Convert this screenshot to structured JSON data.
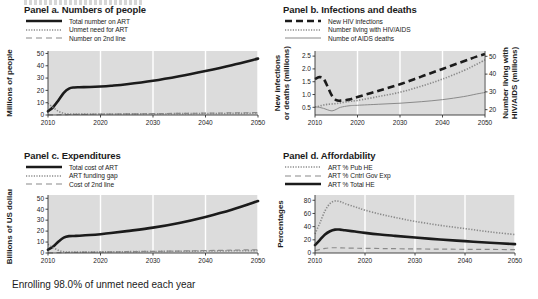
{
  "figure": {
    "caption": "Enrolling 98.0% of unmet need each year",
    "top_partial_text": "",
    "plot_bg": "#dcdcdc",
    "grid_color": "#ffffff",
    "ink": "#1b1b1b"
  },
  "panels": {
    "a": {
      "title": "Panel a. Numbers of people",
      "ylabel": "Millions of people",
      "legend": [
        {
          "label": "Total number on ART",
          "style": "solid-thick",
          "color": "#1a1a1a"
        },
        {
          "label": "Unmet need for ART",
          "style": "dotted",
          "color": "#8a8a8a"
        },
        {
          "label": "Number on 2nd line",
          "style": "dashed",
          "color": "#8a8a8a"
        }
      ]
    },
    "b": {
      "title": "Panel b. Infections and deaths",
      "ylabel_left": "New infections or deaths (millions)",
      "ylabel_right": "Number living with HIV/AIDS (millions)",
      "legend": [
        {
          "label": "New HIV infections",
          "style": "dashed-thick",
          "color": "#1a1a1a"
        },
        {
          "label": "Number living with HIV/AIDS",
          "style": "dotted",
          "color": "#8a8a8a"
        },
        {
          "label": "Numbe of AIDS deaths",
          "style": "solid-thin",
          "color": "#8a8a8a"
        }
      ]
    },
    "c": {
      "title": "Panel c. Expenditures",
      "ylabel": "Billions of  US dollars",
      "legend": [
        {
          "label": "Total cost of ART",
          "style": "solid-thick",
          "color": "#1a1a1a"
        },
        {
          "label": "ART funding gap",
          "style": "dotted",
          "color": "#8a8a8a"
        },
        {
          "label": "Cost of 2nd line",
          "style": "dashed",
          "color": "#8a8a8a"
        }
      ]
    },
    "d": {
      "title": "Panel d. Affordability",
      "ylabel": "Percentages",
      "legend": [
        {
          "label": "ART % Pub HE",
          "style": "dotted",
          "color": "#8a8a8a"
        },
        {
          "label": "ART % Cntrl Gov Exp",
          "style": "dashed",
          "color": "#8a8a8a"
        },
        {
          "label": "ART % Total HE",
          "style": "solid-thick",
          "color": "#1a1a1a"
        }
      ]
    }
  },
  "chart_data": [
    {
      "id": "a",
      "type": "line",
      "title": "Panel a. Numbers of people",
      "xlabel": "",
      "ylabel": "Millions of people",
      "xlim": [
        2010,
        2050
      ],
      "ylim": [
        0,
        52
      ],
      "xticks": [
        2010,
        2020,
        2030,
        2040,
        2050
      ],
      "yticks": [
        0,
        10,
        20,
        30,
        40,
        50
      ],
      "grid": "vertical",
      "legend_position": "above-left",
      "x": [
        2010,
        2011,
        2012,
        2013,
        2014,
        2015,
        2016,
        2018,
        2020,
        2022,
        2025,
        2030,
        2035,
        2040,
        2045,
        2050
      ],
      "series": [
        {
          "name": "Total number on ART",
          "style": "solid-thick",
          "values": [
            3.0,
            6.5,
            12.0,
            18.0,
            21.5,
            22.4,
            22.6,
            22.8,
            23.2,
            23.8,
            25.0,
            27.8,
            31.5,
            35.8,
            40.5,
            45.8
          ]
        },
        {
          "name": "Unmet need for ART",
          "style": "dotted",
          "values": [
            9.5,
            6.0,
            3.0,
            1.4,
            0.8,
            0.7,
            0.7,
            0.7,
            0.8,
            0.8,
            0.9,
            1.0,
            1.1,
            1.2,
            1.3,
            1.4
          ]
        },
        {
          "name": "Number on 2nd line",
          "style": "dashed",
          "values": [
            0.1,
            0.15,
            0.2,
            0.3,
            0.4,
            0.5,
            0.55,
            0.6,
            0.7,
            0.8,
            0.9,
            1.1,
            1.3,
            1.5,
            1.7,
            1.9
          ]
        }
      ]
    },
    {
      "id": "b",
      "type": "line",
      "title": "Panel b. Infections and deaths",
      "xlabel": "",
      "ylabel": "New infections or deaths (millions)",
      "ylabel_secondary": "Number living with HIV/AIDS (millions)",
      "xlim": [
        2010,
        2050
      ],
      "ylim": [
        0.2,
        2.7
      ],
      "ylim_secondary": [
        17,
        53
      ],
      "xticks": [
        2010,
        2020,
        2030,
        2040,
        2050
      ],
      "yticks": [
        0.5,
        1.0,
        1.5,
        2.0,
        2.5
      ],
      "yticks_secondary": [
        20,
        30,
        40,
        50
      ],
      "grid": "vertical",
      "legend_position": "above-left",
      "x": [
        2010,
        2011,
        2012,
        2013,
        2014,
        2015,
        2016,
        2018,
        2020,
        2025,
        2030,
        2035,
        2040,
        2045,
        2048,
        2050
      ],
      "series": [
        {
          "name": "New HIV infections",
          "style": "dashed-thick",
          "axis": "left",
          "values": [
            1.6,
            1.68,
            1.62,
            1.3,
            0.95,
            0.78,
            0.76,
            0.8,
            0.9,
            1.15,
            1.4,
            1.7,
            2.0,
            2.3,
            2.48,
            2.58
          ]
        },
        {
          "name": "Number living with HIV/AIDS",
          "style": "dotted",
          "axis": "right",
          "values": [
            21.5,
            22.0,
            22.6,
            23.0,
            23.2,
            23.4,
            23.8,
            24.6,
            25.2,
            27.4,
            29.8,
            33.2,
            37.2,
            42.0,
            45.5,
            48.0
          ]
        },
        {
          "name": "Numbe of AIDS deaths",
          "style": "solid-thin",
          "axis": "left",
          "values": [
            0.52,
            0.5,
            0.46,
            0.4,
            0.36,
            0.42,
            0.5,
            0.56,
            0.58,
            0.62,
            0.66,
            0.72,
            0.8,
            0.92,
            1.02,
            1.08
          ]
        }
      ]
    },
    {
      "id": "c",
      "type": "line",
      "title": "Panel c. Expenditures",
      "xlabel": "",
      "ylabel": "Billions of  US dollars",
      "xlim": [
        2010,
        2050
      ],
      "ylim": [
        0,
        53
      ],
      "xticks": [
        2010,
        2020,
        2030,
        2040,
        2050
      ],
      "yticks": [
        0,
        10,
        20,
        30,
        40,
        50
      ],
      "grid": "vertical",
      "legend_position": "above-left",
      "x": [
        2010,
        2011,
        2012,
        2013,
        2014,
        2015,
        2016,
        2018,
        2020,
        2022,
        2025,
        2030,
        2035,
        2040,
        2045,
        2050
      ],
      "series": [
        {
          "name": "Total cost of ART",
          "style": "solid-thick",
          "values": [
            3.0,
            6.0,
            10.5,
            14.0,
            15.4,
            15.6,
            15.8,
            16.4,
            17.2,
            18.2,
            20.0,
            23.2,
            27.5,
            33.0,
            39.5,
            47.5
          ]
        },
        {
          "name": "ART funding gap",
          "style": "dotted",
          "values": [
            8.0,
            4.8,
            2.4,
            1.2,
            0.8,
            0.8,
            0.8,
            0.9,
            1.0,
            1.1,
            1.2,
            1.4,
            1.6,
            1.8,
            2.0,
            2.2
          ]
        },
        {
          "name": "Cost of 2nd line",
          "style": "dashed",
          "values": [
            0.1,
            0.2,
            0.3,
            0.4,
            0.5,
            0.6,
            0.7,
            0.8,
            0.9,
            1.0,
            1.2,
            1.5,
            1.8,
            2.2,
            2.6,
            3.0
          ]
        }
      ]
    },
    {
      "id": "d",
      "type": "line",
      "title": "Panel d. Affordability",
      "xlabel": "",
      "ylabel": "Percentages",
      "xlim": [
        2010,
        2050
      ],
      "ylim": [
        0,
        88
      ],
      "xticks": [
        2010,
        2020,
        2030,
        2040,
        2050
      ],
      "yticks": [
        0,
        20,
        40,
        60,
        80
      ],
      "grid": "vertical",
      "legend_position": "above-left",
      "x": [
        2010,
        2011,
        2012,
        2013,
        2014,
        2015,
        2016,
        2018,
        2020,
        2023,
        2026,
        2030,
        2035,
        2040,
        2045,
        2050
      ],
      "series": [
        {
          "name": "ART % Pub HE",
          "style": "dotted",
          "values": [
            29,
            46,
            64,
            75,
            79,
            78,
            75,
            70,
            65,
            59,
            54,
            48,
            42,
            37,
            32,
            28
          ]
        },
        {
          "name": "ART % Cntrl Gov Exp",
          "style": "dashed",
          "values": [
            3.5,
            5.5,
            7.0,
            7.8,
            8.0,
            7.8,
            7.6,
            7.3,
            7.0,
            6.8,
            6.5,
            6.2,
            5.9,
            5.6,
            5.4,
            5.2
          ]
        },
        {
          "name": "ART % Total HE",
          "style": "solid-thick",
          "values": [
            12,
            20,
            28,
            33,
            35.5,
            35.5,
            34.5,
            32.5,
            30.5,
            28,
            26,
            23.5,
            20.5,
            18,
            15.5,
            13.5
          ]
        }
      ]
    }
  ]
}
